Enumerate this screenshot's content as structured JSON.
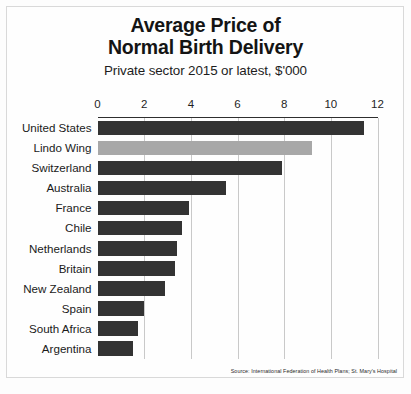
{
  "chart_data": {
    "type": "bar",
    "orientation": "horizontal",
    "title": "Average Price of Normal Birth Delivery",
    "title_lines": [
      "Average Price of",
      "Normal Birth Delivery"
    ],
    "subtitle": "Private sector 2015 or latest, $'000",
    "xlabel": "",
    "ylabel": "",
    "xlim": [
      0,
      12
    ],
    "grid": true,
    "legend": "none",
    "source": "Source: International Federation of Health Plans; St. Mary's Hospital",
    "xticks": [
      "0",
      "2",
      "4",
      "6",
      "8",
      "10",
      "12"
    ],
    "xtick_values": [
      0,
      2,
      4,
      6,
      8,
      10,
      12
    ],
    "categories": [
      "United States",
      "Lindo Wing",
      "Switzerland",
      "Australia",
      "France",
      "Chile",
      "Netherlands",
      "Britain",
      "New Zealand",
      "Spain",
      "South Africa",
      "Argentina"
    ],
    "values": [
      11.4,
      9.2,
      7.9,
      5.5,
      3.9,
      3.6,
      3.4,
      3.3,
      2.9,
      2.0,
      1.75,
      1.5
    ],
    "bar_colors": [
      "#333333",
      "#a8a8a8",
      "#333333",
      "#333333",
      "#333333",
      "#333333",
      "#333333",
      "#333333",
      "#333333",
      "#333333",
      "#333333",
      "#333333"
    ]
  },
  "colors": {
    "bar_default": "#333333",
    "bar_highlight": "#a8a8a8",
    "gridline": "#c9c9c9",
    "axis": "#2e2e2e",
    "background": "#fefefe",
    "text": "#1a1a1a"
  }
}
